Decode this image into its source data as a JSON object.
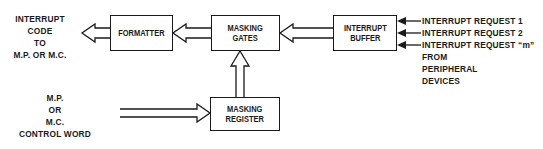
{
  "diagram": {
    "output_label": [
      "INTERRUPT",
      "CODE",
      "TO",
      "M.P. OR M.C."
    ],
    "blocks": {
      "formatter": [
        "FORMATTER"
      ],
      "masking_gates": [
        "MASKING",
        "GATES"
      ],
      "interrupt_buffer": [
        "INTERRUPT",
        "BUFFER"
      ],
      "masking_register": [
        "MASKING",
        "REGISTER"
      ]
    },
    "inputs": [
      "INTERRUPT REQUEST 1",
      "INTERRUPT REQUEST 2",
      "INTERRUPT REQUEST “m”"
    ],
    "inputs_source": [
      "FROM",
      "PERIPHERAL",
      "DEVICES"
    ],
    "control_label": [
      "M.P.",
      "OR",
      "M.C.",
      "CONTROL WORD"
    ],
    "stroke_color": "#1a1a1a"
  }
}
